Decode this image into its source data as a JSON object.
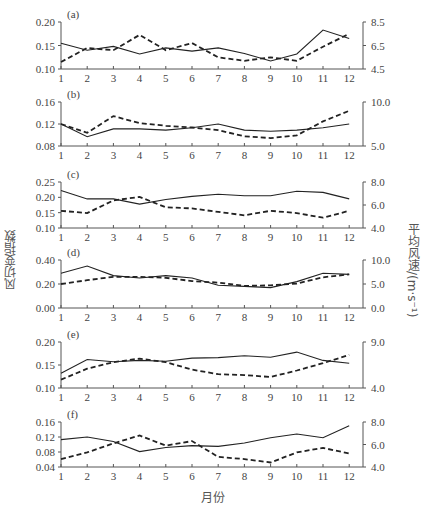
{
  "chart_data": {
    "type": "line",
    "layout": "6 stacked panels, dual y-axes",
    "xlabel": "月份",
    "ylabel_left": "风切变指数",
    "ylabel_right": "平均风速/(m·s⁻¹)",
    "x": [
      1,
      2,
      3,
      4,
      5,
      6,
      7,
      8,
      9,
      10,
      11,
      12
    ],
    "x_tick_labels": [
      "1",
      "2",
      "3",
      "4",
      "5",
      "6",
      "7",
      "8",
      "9",
      "10",
      "11",
      "12"
    ],
    "legend": {
      "solid": "风切变指数 (left axis)",
      "dashed": "平均风速 (right axis)"
    },
    "grid": false,
    "panels": [
      {
        "label": "(a)",
        "left_ylim": [
          0.1,
          0.2
        ],
        "left_ticks": [
          "0.10",
          "0.15",
          "0.20"
        ],
        "right_ylim": [
          4.5,
          8.5
        ],
        "right_ticks": [
          "4.5",
          "6.5",
          "8.5"
        ],
        "series": [
          {
            "name": "风切变指数",
            "axis": "left",
            "style": "solid",
            "values": [
              0.155,
              0.14,
              0.148,
              0.132,
              0.145,
              0.138,
              0.145,
              0.133,
              0.117,
              0.132,
              0.183,
              0.165
            ]
          },
          {
            "name": "平均风速",
            "axis": "right",
            "style": "dashed",
            "values": [
              5.1,
              6.3,
              6.1,
              7.4,
              6.1,
              6.7,
              5.5,
              5.2,
              5.5,
              5.2,
              6.4,
              7.5
            ]
          }
        ]
      },
      {
        "label": "(b)",
        "left_ylim": [
          0.08,
          0.16
        ],
        "left_ticks": [
          "0.08",
          "0.12",
          "0.16"
        ],
        "right_ylim": [
          5.0,
          10.0
        ],
        "right_ticks": [
          "5.0",
          "10.0"
        ],
        "series": [
          {
            "name": "风切变指数",
            "axis": "left",
            "style": "solid",
            "values": [
              0.12,
              0.097,
              0.111,
              0.111,
              0.109,
              0.113,
              0.12,
              0.109,
              0.107,
              0.109,
              0.113,
              0.12
            ]
          },
          {
            "name": "平均风速",
            "axis": "right",
            "style": "dashed",
            "values": [
              7.5,
              6.5,
              8.4,
              7.6,
              7.3,
              7.1,
              6.8,
              6.1,
              5.9,
              6.2,
              7.8,
              9.0
            ]
          }
        ]
      },
      {
        "label": "(c)",
        "left_ylim": [
          0.1,
          0.25
        ],
        "left_ticks": [
          "0.10",
          "0.15",
          "0.20",
          "0.25"
        ],
        "right_ylim": [
          4.0,
          8.0
        ],
        "right_ticks": [
          "4.0",
          "6.0",
          "8.0"
        ],
        "series": [
          {
            "name": "风切变指数",
            "axis": "left",
            "style": "solid",
            "values": [
              0.222,
              0.195,
              0.195,
              0.178,
              0.193,
              0.203,
              0.21,
              0.205,
              0.205,
              0.22,
              0.216,
              0.195
            ]
          },
          {
            "name": "平均风速",
            "axis": "right",
            "style": "dashed",
            "values": [
              5.5,
              5.3,
              6.4,
              6.7,
              5.8,
              5.7,
              5.4,
              5.1,
              5.5,
              5.3,
              4.9,
              5.5
            ]
          }
        ]
      },
      {
        "label": "(d)",
        "left_ylim": [
          0.0,
          0.4
        ],
        "left_ticks": [
          "0.00",
          "0.20",
          "0.40"
        ],
        "right_ylim": [
          0.0,
          10.0
        ],
        "right_ticks": [
          "0.0",
          "5.0",
          "10.0"
        ],
        "series": [
          {
            "name": "风切变指数",
            "axis": "left",
            "style": "solid",
            "values": [
              0.29,
              0.35,
              0.27,
              0.25,
              0.27,
              0.25,
              0.19,
              0.18,
              0.17,
              0.22,
              0.29,
              0.28
            ]
          },
          {
            "name": "平均风速",
            "axis": "right",
            "style": "dashed",
            "values": [
              5.0,
              5.8,
              6.5,
              6.5,
              6.3,
              5.6,
              5.3,
              4.6,
              4.7,
              5.1,
              6.4,
              7.0
            ]
          }
        ]
      },
      {
        "label": "(e)",
        "left_ylim": [
          0.1,
          0.2
        ],
        "left_ticks": [
          "0.10",
          "0.15",
          "0.20"
        ],
        "right_ylim": [
          4.0,
          9.0
        ],
        "right_ticks": [
          "4.0",
          "9.0"
        ],
        "series": [
          {
            "name": "风切变指数",
            "axis": "left",
            "style": "solid",
            "values": [
              0.132,
              0.162,
              0.157,
              0.16,
              0.158,
              0.165,
              0.166,
              0.17,
              0.167,
              0.178,
              0.16,
              0.154
            ]
          },
          {
            "name": "平均风速",
            "axis": "right",
            "style": "dashed",
            "values": [
              4.9,
              6.1,
              6.8,
              7.2,
              6.8,
              6.0,
              5.5,
              5.4,
              5.2,
              5.9,
              6.7,
              7.6
            ]
          }
        ]
      },
      {
        "label": "(f)",
        "left_ylim": [
          0.04,
          0.16
        ],
        "left_ticks": [
          "0.04",
          "0.08",
          "0.12",
          "0.16"
        ],
        "right_ylim": [
          4.0,
          8.0
        ],
        "right_ticks": [
          "4.0",
          "6.0",
          "8.0"
        ],
        "series": [
          {
            "name": "风切变指数",
            "axis": "left",
            "style": "solid",
            "values": [
              0.113,
              0.12,
              0.108,
              0.081,
              0.092,
              0.097,
              0.095,
              0.104,
              0.118,
              0.128,
              0.118,
              0.15
            ]
          },
          {
            "name": "平均风速",
            "axis": "right",
            "style": "dashed",
            "values": [
              4.7,
              5.3,
              6.1,
              6.8,
              5.9,
              6.3,
              4.9,
              4.7,
              4.4,
              5.3,
              5.7,
              5.2
            ]
          }
        ]
      }
    ]
  },
  "colors": {
    "axis": "#555555",
    "line": "#222222",
    "text": "#444444"
  }
}
